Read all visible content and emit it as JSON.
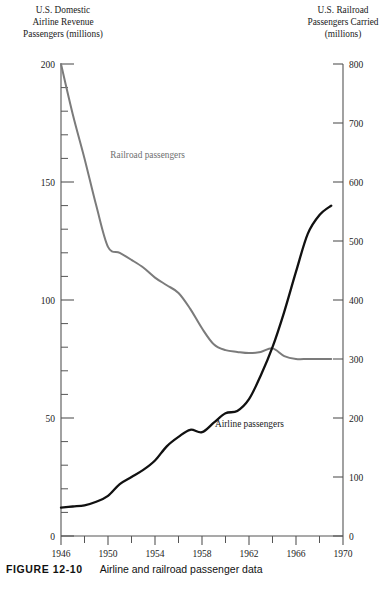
{
  "figure": {
    "caption_label": "FIGURE 12-10",
    "caption_text": "Airline and railroad passenger data"
  },
  "chart_data": {
    "type": "line",
    "title": "",
    "xlabel": "",
    "xlim": [
      1946,
      1970
    ],
    "x_major_ticks": [
      1946,
      1950,
      1954,
      1958,
      1962,
      1966,
      1970
    ],
    "x_minor_step": 2,
    "x_tick_labels": [
      "1946",
      "1950",
      "1954",
      "1958",
      "1962",
      "1966",
      "1970"
    ],
    "grid": false,
    "legend_position": "inline-annotations",
    "axes": [
      {
        "id": "left",
        "title": "U.S. Domestic\nAirline Revenue\nPassengers (millions)",
        "title_lines": [
          "U.S. Domestic",
          "Airline Revenue",
          "Passengers (millions)"
        ],
        "ylim": [
          0,
          200
        ],
        "major_ticks": [
          0,
          50,
          100,
          150,
          200
        ],
        "major_tick_labels": [
          "0",
          "50",
          "100",
          "150",
          "200"
        ],
        "minor_step": 10
      },
      {
        "id": "right",
        "title": "U.S. Railroad\nPassengers Carried\n(millions)",
        "title_lines": [
          "U.S. Railroad",
          "Passengers Carried",
          "(millions)"
        ],
        "ylim": [
          0,
          800
        ],
        "major_ticks": [
          0,
          100,
          200,
          300,
          400,
          500,
          600,
          700,
          800
        ],
        "major_tick_labels": [
          "0",
          "100",
          "200",
          "300",
          "400",
          "500",
          "600",
          "700",
          "800"
        ],
        "minor_step": 0
      }
    ],
    "series": [
      {
        "name": "Railroad passengers",
        "axis": "right",
        "color": "#7b7b7b",
        "width": 2.0,
        "label_x": 1950.2,
        "label_y": 640,
        "x": [
          1946,
          1947,
          1948,
          1949,
          1950,
          1951,
          1952,
          1953,
          1954,
          1955,
          1956,
          1957,
          1958,
          1959,
          1960,
          1961,
          1962,
          1963,
          1964,
          1965,
          1966,
          1967,
          1968,
          1969
        ],
        "values": [
          800,
          715,
          640,
          560,
          490,
          480,
          468,
          455,
          438,
          425,
          412,
          385,
          352,
          325,
          315,
          312,
          310,
          312,
          318,
          305,
          300,
          300,
          300,
          300
        ]
      },
      {
        "name": "Airline passengers",
        "axis": "left",
        "color": "#111111",
        "width": 2.3,
        "label_x": 1959.1,
        "label_y": 46,
        "x": [
          1946,
          1947,
          1948,
          1949,
          1950,
          1951,
          1952,
          1953,
          1954,
          1955,
          1956,
          1957,
          1958,
          1959,
          1960,
          1961,
          1962,
          1963,
          1964,
          1965,
          1966,
          1967,
          1968,
          1969
        ],
        "values": [
          12,
          12.5,
          13,
          14.5,
          17,
          22,
          25,
          28,
          32,
          38,
          42,
          45,
          44,
          48,
          52,
          53,
          58,
          68,
          80,
          95,
          112,
          128,
          136,
          140
        ]
      }
    ],
    "annotations": [
      {
        "text": "Railroad passengers",
        "series": "Railroad passengers"
      },
      {
        "text": "Airline passengers",
        "series": "Airline passengers"
      }
    ]
  }
}
